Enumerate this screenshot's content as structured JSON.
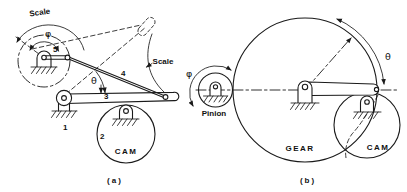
{
  "figure": {
    "background_color": "#ffffff",
    "ink_color": "#1a1a1a",
    "panel_a": {
      "caption": "(a)",
      "scale_label_top": "Scale",
      "scale_label_right": "Scale",
      "phi_label": "φ",
      "theta_label": "θ",
      "link_1": "1",
      "link_2": "2",
      "link_3": "3",
      "link_4": "4",
      "link_5": "5",
      "cam_label": "CAM"
    },
    "panel_b": {
      "caption": "(b)",
      "phi_label": "φ",
      "theta_label": "θ",
      "pinion_label": "Pinion",
      "gear_label": "GEAR",
      "cam_label": "CAM"
    }
  }
}
